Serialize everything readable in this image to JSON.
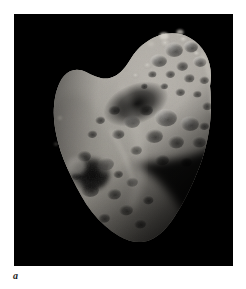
{
  "figure": {
    "caption_label": "a",
    "panel_name": "asteroid-photograph-panel",
    "background_color": "#ffffff",
    "photo": {
      "alt_name": "asteroid-eros-photograph",
      "space_background_color": "#000000",
      "surface_highlight_color": "#d8d4cc",
      "surface_midtone_color": "#8d8982",
      "surface_shadow_color": "#2a2824",
      "terminator_shadow_color": "#050505",
      "subject": "asteroid",
      "frame": {
        "left": 14,
        "top": 14,
        "width": 219,
        "height": 252
      }
    }
  }
}
